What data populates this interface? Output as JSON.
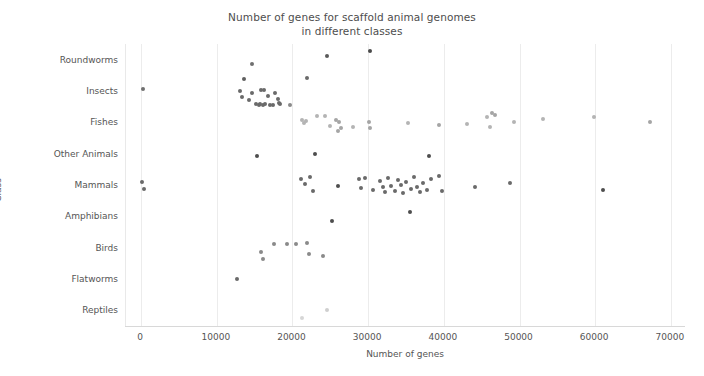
{
  "chart_data": {
    "type": "scatter",
    "title": "Number of genes for scaffold animal genomes\nin different classes",
    "title_line1": "Number of genes for scaffold animal genomes",
    "title_line2": "in different classes",
    "xlabel": "Number of genes",
    "ylabel": "Class",
    "xlim": [
      -2000,
      72000
    ],
    "xticks": [
      0,
      10000,
      20000,
      30000,
      40000,
      50000,
      60000,
      70000
    ],
    "xticklabels": [
      "0",
      "10000",
      "20000",
      "30000",
      "40000",
      "50000",
      "60000",
      "70000"
    ],
    "categories": [
      "Roundworms",
      "Insects",
      "Fishes",
      "Other Animals",
      "Mammals",
      "Amphibians",
      "Birds",
      "Flatworms",
      "Reptiles"
    ],
    "grid": "vertical",
    "legend": "none",
    "marker_size": 4,
    "colors": {
      "dark_point": "#555555",
      "mid_point": "#7d7d7d",
      "light_point": "#b4b4b4",
      "very_light_point": "#d6d6d6",
      "gridline": "#ececec",
      "axis": "#d8d8d8",
      "text": "#555555",
      "background": "#ffffff"
    },
    "series": [
      {
        "name": "Roundworms",
        "category_index": 0,
        "points": [
          {
            "x": 14600,
            "y": "Roundworms",
            "jitter": 4,
            "color": "#6f6f6f"
          },
          {
            "x": 24500,
            "y": "Roundworms",
            "jitter": -4,
            "color": "#5a5a5a"
          },
          {
            "x": 30300,
            "y": "Roundworms",
            "jitter": -9,
            "color": "#4a4a4a"
          }
        ]
      },
      {
        "name": "Insects",
        "category_index": 1,
        "points": [
          {
            "x": 300,
            "y": "Insects",
            "jitter": -2,
            "color": "#6f6f6f"
          },
          {
            "x": 13600,
            "y": "Insects",
            "jitter": -12,
            "color": "#5f5f5f"
          },
          {
            "x": 13100,
            "y": "Insects",
            "jitter": 0,
            "color": "#6a6a6a"
          },
          {
            "x": 13300,
            "y": "Insects",
            "jitter": 6,
            "color": "#6a6a6a"
          },
          {
            "x": 14200,
            "y": "Insects",
            "jitter": 9,
            "color": "#6a6a6a"
          },
          {
            "x": 14700,
            "y": "Insects",
            "jitter": 2,
            "color": "#6a6a6a"
          },
          {
            "x": 15200,
            "y": "Insects",
            "jitter": 13,
            "color": "#6a6a6a"
          },
          {
            "x": 15600,
            "y": "Insects",
            "jitter": 14,
            "color": "#6a6a6a"
          },
          {
            "x": 15700,
            "y": "Insects",
            "jitter": 13,
            "color": "#6a6a6a"
          },
          {
            "x": 16100,
            "y": "Insects",
            "jitter": 14,
            "color": "#6a6a6a"
          },
          {
            "x": 16400,
            "y": "Insects",
            "jitter": 13,
            "color": "#6a6a6a"
          },
          {
            "x": 15900,
            "y": "Insects",
            "jitter": -1,
            "color": "#6a6a6a"
          },
          {
            "x": 16300,
            "y": "Insects",
            "jitter": -1,
            "color": "#6a6a6a"
          },
          {
            "x": 16700,
            "y": "Insects",
            "jitter": 5,
            "color": "#6a6a6a"
          },
          {
            "x": 17000,
            "y": "Insects",
            "jitter": 14,
            "color": "#6a6a6a"
          },
          {
            "x": 17400,
            "y": "Insects",
            "jitter": 14,
            "color": "#6a6a6a"
          },
          {
            "x": 17700,
            "y": "Insects",
            "jitter": 2,
            "color": "#6a6a6a"
          },
          {
            "x": 18100,
            "y": "Insects",
            "jitter": 8,
            "color": "#6a6a6a"
          },
          {
            "x": 18200,
            "y": "Insects",
            "jitter": 12,
            "color": "#6a6a6a"
          },
          {
            "x": 18400,
            "y": "Insects",
            "jitter": 13,
            "color": "#6a6a6a"
          },
          {
            "x": 19700,
            "y": "Insects",
            "jitter": 14,
            "color": "#8a8a8a"
          },
          {
            "x": 21900,
            "y": "Insects",
            "jitter": -13,
            "color": "#6a6a6a"
          }
        ]
      },
      {
        "name": "Fishes",
        "category_index": 2,
        "points": [
          {
            "x": 21200,
            "y": "Fishes",
            "jitter": -2,
            "color": "#b4b4b4"
          },
          {
            "x": 21500,
            "y": "Fishes",
            "jitter": 1,
            "color": "#b4b4b4"
          },
          {
            "x": 21800,
            "y": "Fishes",
            "jitter": -1,
            "color": "#b4b4b4"
          },
          {
            "x": 23200,
            "y": "Fishes",
            "jitter": -6,
            "color": "#b4b4b4"
          },
          {
            "x": 24300,
            "y": "Fishes",
            "jitter": -6,
            "color": "#b4b4b4"
          },
          {
            "x": 24900,
            "y": "Fishes",
            "jitter": 4,
            "color": "#b4b4b4"
          },
          {
            "x": 25800,
            "y": "Fishes",
            "jitter": -2,
            "color": "#a5a5a5"
          },
          {
            "x": 26200,
            "y": "Fishes",
            "jitter": 0,
            "color": "#a5a5a5"
          },
          {
            "x": 26400,
            "y": "Fishes",
            "jitter": 6,
            "color": "#a5a5a5"
          },
          {
            "x": 26000,
            "y": "Fishes",
            "jitter": 9,
            "color": "#a5a5a5"
          },
          {
            "x": 28000,
            "y": "Fishes",
            "jitter": 5,
            "color": "#b4b4b4"
          },
          {
            "x": 30100,
            "y": "Fishes",
            "jitter": 0,
            "color": "#a5a5a5"
          },
          {
            "x": 30300,
            "y": "Fishes",
            "jitter": 6,
            "color": "#a5a5a5"
          },
          {
            "x": 35200,
            "y": "Fishes",
            "jitter": 1,
            "color": "#b4b4b4"
          },
          {
            "x": 39400,
            "y": "Fishes",
            "jitter": 3,
            "color": "#a5a5a5"
          },
          {
            "x": 43000,
            "y": "Fishes",
            "jitter": 2,
            "color": "#b4b4b4"
          },
          {
            "x": 45700,
            "y": "Fishes",
            "jitter": -5,
            "color": "#b4b4b4"
          },
          {
            "x": 46400,
            "y": "Fishes",
            "jitter": -9,
            "color": "#a5a5a5"
          },
          {
            "x": 46800,
            "y": "Fishes",
            "jitter": -7,
            "color": "#a5a5a5"
          },
          {
            "x": 46100,
            "y": "Fishes",
            "jitter": 5,
            "color": "#b4b4b4"
          },
          {
            "x": 49300,
            "y": "Fishes",
            "jitter": 0,
            "color": "#b4b4b4"
          },
          {
            "x": 53100,
            "y": "Fishes",
            "jitter": -3,
            "color": "#b4b4b4"
          },
          {
            "x": 59800,
            "y": "Fishes",
            "jitter": -5,
            "color": "#b4b4b4"
          },
          {
            "x": 67300,
            "y": "Fishes",
            "jitter": 0,
            "color": "#a5a5a5"
          }
        ]
      },
      {
        "name": "Other Animals",
        "category_index": 3,
        "points": [
          {
            "x": 15300,
            "y": "Other Animals",
            "jitter": 2,
            "color": "#4d4d4d"
          },
          {
            "x": 23000,
            "y": "Other Animals",
            "jitter": 0,
            "color": "#4d4d4d"
          },
          {
            "x": 38000,
            "y": "Other Animals",
            "jitter": 2,
            "color": "#4d4d4d"
          }
        ]
      },
      {
        "name": "Mammals",
        "category_index": 4,
        "points": [
          {
            "x": 100,
            "y": "Mammals",
            "jitter": -3,
            "color": "#6a6a6a"
          },
          {
            "x": 400,
            "y": "Mammals",
            "jitter": 4,
            "color": "#6a6a6a"
          },
          {
            "x": 21100,
            "y": "Mammals",
            "jitter": -6,
            "color": "#6a6a6a"
          },
          {
            "x": 21600,
            "y": "Mammals",
            "jitter": -1,
            "color": "#6a6a6a"
          },
          {
            "x": 22300,
            "y": "Mammals",
            "jitter": -8,
            "color": "#6a6a6a"
          },
          {
            "x": 22700,
            "y": "Mammals",
            "jitter": 6,
            "color": "#6a6a6a"
          },
          {
            "x": 26000,
            "y": "Mammals",
            "jitter": 1,
            "color": "#4d4d4d"
          },
          {
            "x": 28800,
            "y": "Mammals",
            "jitter": -6,
            "color": "#6a6a6a"
          },
          {
            "x": 29100,
            "y": "Mammals",
            "jitter": 3,
            "color": "#6a6a6a"
          },
          {
            "x": 29600,
            "y": "Mammals",
            "jitter": -7,
            "color": "#6a6a6a"
          },
          {
            "x": 30600,
            "y": "Mammals",
            "jitter": 5,
            "color": "#6a6a6a"
          },
          {
            "x": 31600,
            "y": "Mammals",
            "jitter": -4,
            "color": "#6a6a6a"
          },
          {
            "x": 31900,
            "y": "Mammals",
            "jitter": 2,
            "color": "#6a6a6a"
          },
          {
            "x": 32200,
            "y": "Mammals",
            "jitter": 7,
            "color": "#6a6a6a"
          },
          {
            "x": 32600,
            "y": "Mammals",
            "jitter": -7,
            "color": "#6a6a6a"
          },
          {
            "x": 33000,
            "y": "Mammals",
            "jitter": 1,
            "color": "#6a6a6a"
          },
          {
            "x": 33500,
            "y": "Mammals",
            "jitter": 6,
            "color": "#6a6a6a"
          },
          {
            "x": 33900,
            "y": "Mammals",
            "jitter": -5,
            "color": "#6a6a6a"
          },
          {
            "x": 34300,
            "y": "Mammals",
            "jitter": 0,
            "color": "#6a6a6a"
          },
          {
            "x": 34600,
            "y": "Mammals",
            "jitter": 8,
            "color": "#6a6a6a"
          },
          {
            "x": 35000,
            "y": "Mammals",
            "jitter": -3,
            "color": "#6a6a6a"
          },
          {
            "x": 35600,
            "y": "Mammals",
            "jitter": 4,
            "color": "#6a6a6a"
          },
          {
            "x": 36000,
            "y": "Mammals",
            "jitter": -8,
            "color": "#6a6a6a"
          },
          {
            "x": 36400,
            "y": "Mammals",
            "jitter": 2,
            "color": "#6a6a6a"
          },
          {
            "x": 36900,
            "y": "Mammals",
            "jitter": 7,
            "color": "#6a6a6a"
          },
          {
            "x": 37300,
            "y": "Mammals",
            "jitter": -2,
            "color": "#6a6a6a"
          },
          {
            "x": 37800,
            "y": "Mammals",
            "jitter": 5,
            "color": "#6a6a6a"
          },
          {
            "x": 38300,
            "y": "Mammals",
            "jitter": -6,
            "color": "#6a6a6a"
          },
          {
            "x": 39400,
            "y": "Mammals",
            "jitter": -9,
            "color": "#6a6a6a"
          },
          {
            "x": 39700,
            "y": "Mammals",
            "jitter": 6,
            "color": "#6a6a6a"
          },
          {
            "x": 44100,
            "y": "Mammals",
            "jitter": 2,
            "color": "#6a6a6a"
          },
          {
            "x": 48700,
            "y": "Mammals",
            "jitter": -2,
            "color": "#6a6a6a"
          },
          {
            "x": 61000,
            "y": "Mammals",
            "jitter": 5,
            "color": "#4d4d4d"
          }
        ]
      },
      {
        "name": "Amphibians",
        "category_index": 5,
        "points": [
          {
            "x": 25200,
            "y": "Amphibians",
            "jitter": 5,
            "color": "#4d4d4d"
          },
          {
            "x": 35500,
            "y": "Amphibians",
            "jitter": -4,
            "color": "#4d4d4d"
          }
        ]
      },
      {
        "name": "Birds",
        "category_index": 6,
        "points": [
          {
            "x": 15900,
            "y": "Birds",
            "jitter": 4,
            "color": "#8a8a8a"
          },
          {
            "x": 16100,
            "y": "Birds",
            "jitter": 11,
            "color": "#8a8a8a"
          },
          {
            "x": 17600,
            "y": "Birds",
            "jitter": -4,
            "color": "#8a8a8a"
          },
          {
            "x": 19300,
            "y": "Birds",
            "jitter": -4,
            "color": "#8a8a8a"
          },
          {
            "x": 20400,
            "y": "Birds",
            "jitter": -4,
            "color": "#8a8a8a"
          },
          {
            "x": 21900,
            "y": "Birds",
            "jitter": -5,
            "color": "#8a8a8a"
          },
          {
            "x": 22200,
            "y": "Birds",
            "jitter": 6,
            "color": "#8a8a8a"
          },
          {
            "x": 24000,
            "y": "Birds",
            "jitter": 8,
            "color": "#8a8a8a"
          }
        ]
      },
      {
        "name": "Flatworms",
        "category_index": 7,
        "points": [
          {
            "x": 12700,
            "y": "Flatworms",
            "jitter": 0,
            "color": "#6a6a6a"
          }
        ]
      },
      {
        "name": "Reptiles",
        "category_index": 8,
        "points": [
          {
            "x": 21200,
            "y": "Reptiles",
            "jitter": 8,
            "color": "#d6d6d6"
          },
          {
            "x": 24500,
            "y": "Reptiles",
            "jitter": 0,
            "color": "#cfcfcf"
          }
        ]
      }
    ]
  }
}
